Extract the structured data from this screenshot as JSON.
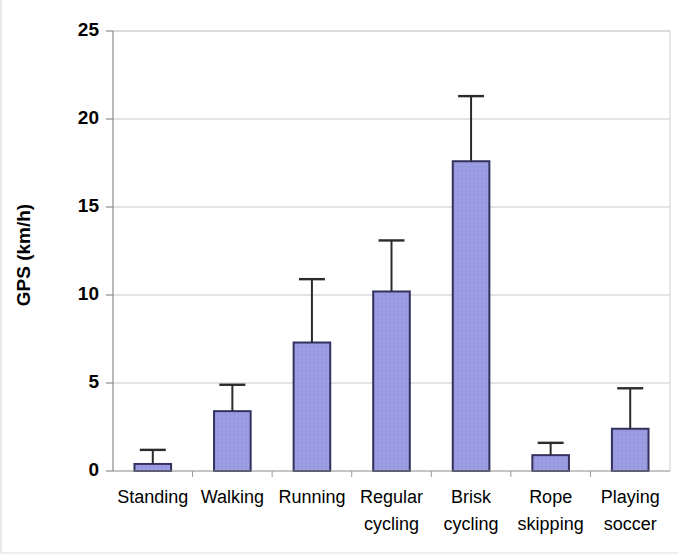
{
  "chart_data": {
    "type": "bar",
    "title": "",
    "xlabel": "",
    "ylabel": "GPS (km/h)",
    "ylim": [
      0,
      25
    ],
    "ytick_step": 5,
    "yticks": [
      0,
      5,
      10,
      15,
      20,
      25
    ],
    "ytick_labels": [
      "0",
      "5",
      "10",
      "15",
      "20",
      "25"
    ],
    "grid": "horizontal",
    "legend": "none",
    "bar_fill_color": "#9a9ae0",
    "bar_edge_color": "#33325e",
    "error_bar_color": "#2b2b2b",
    "error_type": "standard deviation",
    "categories": [
      "Standing",
      "Walking",
      "Running",
      "Regular cycling",
      "Brisk cycling",
      "Rope skipping",
      "Playing soccer"
    ],
    "category_label_lines": [
      [
        "Standing"
      ],
      [
        "Walking"
      ],
      [
        "Running"
      ],
      [
        "Regular",
        "cycling"
      ],
      [
        "Brisk",
        "cycling"
      ],
      [
        "Rope",
        "skipping"
      ],
      [
        "Playing",
        "soccer"
      ]
    ],
    "series": [
      {
        "name": "GPS speed",
        "values": [
          0.4,
          3.4,
          7.3,
          10.2,
          17.6,
          0.9,
          2.4
        ],
        "errors_upper": [
          1.2,
          4.9,
          10.9,
          13.1,
          21.3,
          1.6,
          4.7
        ]
      }
    ]
  }
}
